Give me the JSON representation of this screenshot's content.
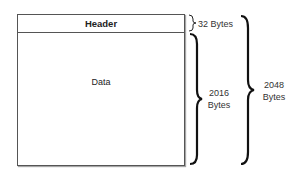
{
  "diagram": {
    "header_label": "Header",
    "data_label": "Data",
    "header_size": "32 Bytes",
    "data_size_line1": "2016",
    "data_size_line2": "Bytes",
    "total_size_line1": "2048",
    "total_size_line2": "Bytes"
  }
}
